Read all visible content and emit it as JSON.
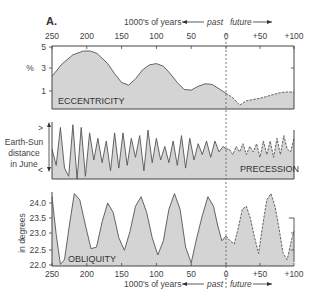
{
  "figure_label": "A.",
  "axis": {
    "title": "1000's of years",
    "past_label": "past",
    "future_label": "future",
    "x_ticks": [
      "250",
      "200",
      "150",
      "100",
      "50",
      "0",
      "+50",
      "+100"
    ]
  },
  "colors": {
    "fill": "#d4d4d4",
    "line": "#555555",
    "frame": "#444444",
    "dashed_divider": "#666666"
  },
  "chart_data": [
    {
      "type": "area",
      "title": "ECCENTRICITY",
      "xlabel": "1000's of years (past negative, future positive)",
      "ylabel": "%",
      "y_ticks": [
        "5",
        "3",
        "1"
      ],
      "ylim": [
        0,
        5
      ],
      "xlim": [
        -250,
        100
      ],
      "x": [
        -250,
        -235,
        -220,
        -205,
        -195,
        -185,
        -170,
        -160,
        -150,
        -140,
        -130,
        -120,
        -110,
        -100,
        -90,
        -80,
        -70,
        -60,
        -50,
        -40,
        -30,
        -20,
        -10,
        0,
        10,
        20,
        30,
        40,
        50,
        60,
        70,
        80,
        90,
        100
      ],
      "values": [
        2.6,
        3.6,
        4.3,
        4.6,
        4.6,
        4.4,
        3.6,
        2.8,
        2.1,
        1.9,
        2.4,
        3.1,
        3.5,
        3.6,
        3.4,
        2.8,
        2.1,
        1.55,
        1.5,
        1.8,
        2.0,
        1.95,
        1.6,
        1.25,
        0.9,
        0.3,
        0.65,
        0.75,
        0.85,
        1.0,
        1.15,
        1.3,
        1.35,
        1.35
      ],
      "future_projection_dashed": true
    },
    {
      "type": "area",
      "title": "PRECESSION",
      "ylabel": "Earth-Sun distance in June",
      "y_ticks": [
        ">",
        "<"
      ],
      "xlim": [
        -250,
        100
      ],
      "x": [
        -250,
        -244,
        -238,
        -232,
        -226,
        -220,
        -214,
        -208,
        -202,
        -196,
        -190,
        -184,
        -178,
        -172,
        -166,
        -160,
        -154,
        -148,
        -142,
        -136,
        -130,
        -124,
        -118,
        -112,
        -106,
        -100,
        -94,
        -88,
        -82,
        -76,
        -70,
        -64,
        -58,
        -52,
        -46,
        -40,
        -34,
        -28,
        -22,
        -16,
        -10,
        -4,
        0,
        5,
        10,
        15,
        20,
        25,
        30,
        35,
        40,
        45,
        50,
        55,
        60,
        65,
        70,
        75,
        80,
        85,
        90,
        95,
        100
      ],
      "values": [
        0.55,
        0.25,
        0.95,
        0.2,
        0.05,
        1.0,
        0.0,
        0.95,
        0.05,
        0.85,
        0.35,
        0.75,
        0.3,
        0.7,
        0.15,
        0.85,
        0.2,
        0.85,
        0.25,
        0.75,
        0.4,
        0.8,
        0.15,
        0.9,
        0.3,
        0.75,
        0.35,
        0.6,
        0.3,
        0.7,
        0.25,
        0.8,
        0.2,
        0.75,
        0.35,
        0.65,
        0.45,
        0.7,
        0.4,
        0.7,
        0.5,
        0.6,
        0.55,
        0.55,
        0.45,
        0.6,
        0.5,
        0.65,
        0.45,
        0.6,
        0.5,
        0.65,
        0.4,
        0.7,
        0.45,
        0.7,
        0.4,
        0.75,
        0.45,
        0.8,
        0.55,
        0.5,
        0.75
      ],
      "future_projection_dashed": true
    },
    {
      "type": "area",
      "title": "OBLIQUITY",
      "ylabel": "in degrees",
      "y_ticks": [
        "24.0",
        "23.5",
        "23.0",
        "22.5",
        "22.0"
      ],
      "ylim": [
        22.0,
        24.3
      ],
      "xlim": [
        -250,
        100
      ],
      "x": [
        -250,
        -244,
        -238,
        -232,
        -225,
        -218,
        -210,
        -202,
        -194,
        -186,
        -178,
        -170,
        -162,
        -154,
        -146,
        -138,
        -130,
        -122,
        -114,
        -106,
        -98,
        -90,
        -82,
        -74,
        -66,
        -58,
        -50,
        -42,
        -34,
        -26,
        -18,
        -12,
        -6,
        0,
        6,
        12,
        18,
        24,
        30,
        36,
        42,
        48,
        54,
        60,
        66,
        72,
        78,
        84,
        90,
        96,
        100
      ],
      "values": [
        24.2,
        23.0,
        22.05,
        22.2,
        23.3,
        24.3,
        24.1,
        23.3,
        22.55,
        22.6,
        23.4,
        24.0,
        23.7,
        22.9,
        22.5,
        23.1,
        23.9,
        24.2,
        23.7,
        22.9,
        22.35,
        22.8,
        23.8,
        24.3,
        23.8,
        22.6,
        22.1,
        22.9,
        23.6,
        24.2,
        23.9,
        23.3,
        22.8,
        22.95,
        22.8,
        22.7,
        23.2,
        23.8,
        23.9,
        23.5,
        22.9,
        22.4,
        23.3,
        24.1,
        24.3,
        23.9,
        23.2,
        22.4,
        22.2,
        22.8,
        23.1
      ],
      "future_projection_dashed": true
    }
  ]
}
